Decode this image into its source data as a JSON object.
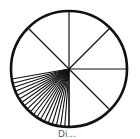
{
  "diagram": {
    "type": "circle-with-radial-spokes",
    "center": [
      69,
      69
    ],
    "radius": 58,
    "stroke_color": "#111111",
    "background": "#ffffff",
    "major_spokes_deg": [
      90,
      135,
      45,
      0,
      -45,
      -90
    ],
    "fan": {
      "start_deg": 190,
      "end_deg": 270,
      "count": 20
    },
    "caption": "Di..."
  }
}
